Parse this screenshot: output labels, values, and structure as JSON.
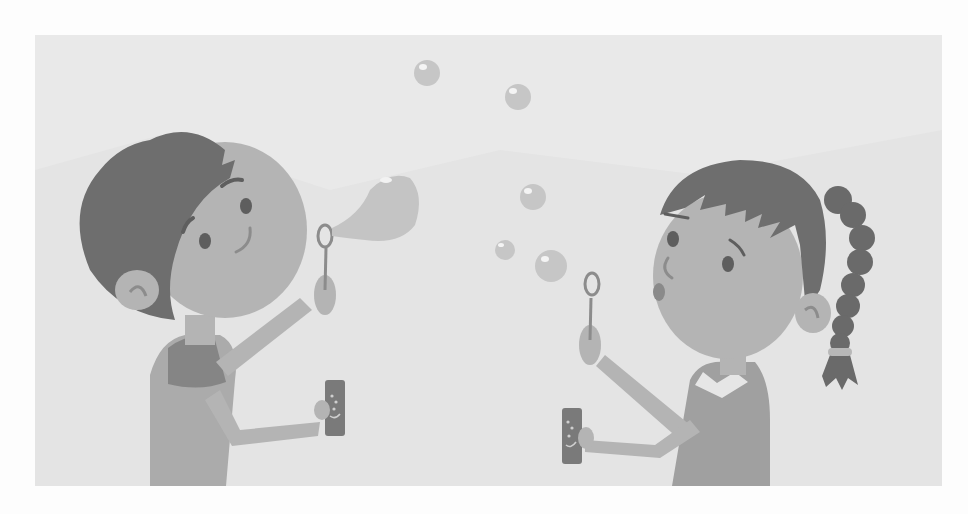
{
  "illustration": {
    "description": "Grayscale illustration of a boy and a girl blowing soap bubbles",
    "subjects": [
      "boy-blowing-bubble",
      "girl-blowing-bubbles"
    ],
    "colors": {
      "page_background": "#fdfdfd",
      "panel_background": "#e9e9e9",
      "skin": "#b4b4b4",
      "hair": "#6e6e6e",
      "shirt": "#a8a8a8",
      "collar": "#858585",
      "bubble": "#c4c4c4",
      "bubble_highlight": "#f4f4f4",
      "tube": "#7a7a7a",
      "features": "#5e5e5e"
    }
  }
}
